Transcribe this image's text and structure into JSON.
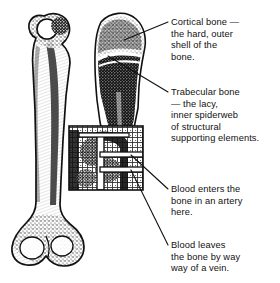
{
  "figure": {
    "background_color": "#ffffff",
    "ink_color": "#111111",
    "width": 280,
    "height": 283
  },
  "illustrations": {
    "whole_bone": {
      "name": "whole femur, exterior view",
      "description": "Full-length long bone shown from the outside, rounded head and neck at top, narrow shaft, flared condyles at bottom."
    },
    "sectioned_bone": {
      "name": "femur head longitudinal section",
      "description": "Upper end of the femur cut lengthwise, revealing dense dark trabecular bone inside a thin pale cortical shell."
    },
    "inset_box": {
      "name": "magnified shaft detail",
      "description": "Square inset enlarging a region of the shaft to show the lacy trabecular network and the blood vessels entering and leaving the bone."
    }
  },
  "callouts": [
    {
      "id": "cortical",
      "text": "Cortical bone —\nthe hard, outer\nshell of the\nbone.",
      "points_to": "outer edge of the sectioned bone head"
    },
    {
      "id": "trabecular",
      "text": "Trabecular bone\n— the lacy,\ninner spiderweb\nof structural\nsupporting elements.",
      "points_to": "spongy interior of the sectioned bone head"
    },
    {
      "id": "artery",
      "text": "Blood enters the\nbone in an artery\nhere.",
      "points_to": "upper vessel in the magnified shaft inset"
    },
    {
      "id": "vein",
      "text": "Blood leaves\nthe bone by way\nway of a vein.",
      "points_to": "lower vessel in the magnified shaft inset"
    }
  ]
}
